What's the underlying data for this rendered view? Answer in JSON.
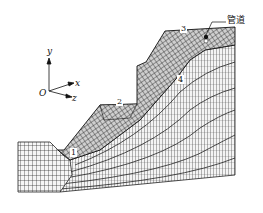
{
  "figure": {
    "type": "finite-element-mesh",
    "pipeline_label": "管道",
    "monitor_points": [
      {
        "id": "1",
        "label": "1"
      },
      {
        "id": "2",
        "label": "2"
      },
      {
        "id": "3",
        "label": "3"
      },
      {
        "id": "4",
        "label": "4"
      }
    ],
    "axes": {
      "origin": "O",
      "y": "y",
      "x": "x",
      "z": "z"
    },
    "colors": {
      "mesh": "#222222",
      "background": "#ffffff"
    }
  }
}
